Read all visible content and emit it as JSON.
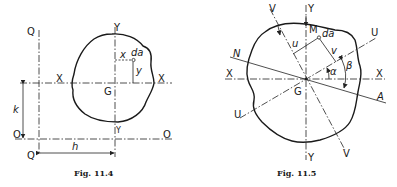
{
  "figures": [
    {
      "id": "fig-11-4",
      "caption": "Fig. 11.4",
      "labels": {
        "q_top": "Q",
        "q_bottom": "Q",
        "y_top": "Y",
        "y_bottom": "Y",
        "x_left": "X",
        "x_right": "X",
        "o_left": "O",
        "o_right": "O",
        "centroid": "G",
        "element": "da",
        "x_dist": "x",
        "y_dist": "y",
        "k_dist": "k",
        "h_dist": "h"
      }
    },
    {
      "id": "fig-11-5",
      "caption": "Fig. 11.5",
      "labels": {
        "v_top": "V",
        "v_bottom": "V",
        "y_top": "Y",
        "y_bottom": "Y",
        "x_left": "X",
        "x_right": "X",
        "u_left": "U",
        "u_right": "U",
        "n_label": "N",
        "a_label": "A",
        "centroid": "G",
        "m_label": "M",
        "element": "da",
        "u_dist": "u",
        "v_dist": "v",
        "alpha": "α",
        "beta": "β"
      }
    }
  ]
}
